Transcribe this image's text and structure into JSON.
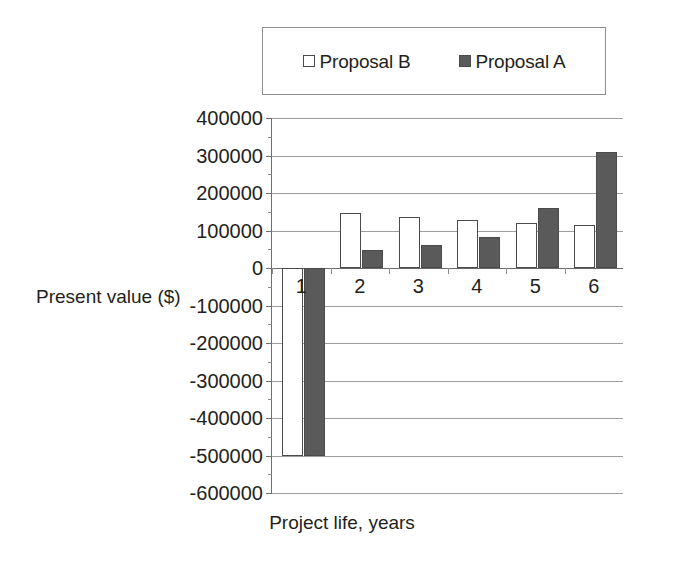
{
  "chart_data": {
    "type": "bar",
    "title": "",
    "xlabel": "Project life, years",
    "ylabel": "Present value ($)",
    "categories": [
      "1",
      "2",
      "3",
      "4",
      "5",
      "6"
    ],
    "series": [
      {
        "name": "Proposal B",
        "values": [
          -500000,
          147000,
          137000,
          128000,
          120000,
          115000
        ],
        "color": "#ffffff"
      },
      {
        "name": "Proposal A",
        "values": [
          -500000,
          48000,
          62000,
          83000,
          160000,
          310000
        ],
        "color": "#5a5a5a"
      }
    ],
    "ylim": [
      -600000,
      400000
    ],
    "ytick_step": 100000,
    "yticks": [
      400000,
      300000,
      200000,
      100000,
      0,
      -100000,
      -200000,
      -300000,
      -400000,
      -500000,
      -600000
    ],
    "ytick_labels": [
      "400000",
      "300000",
      "200000",
      "100000",
      "0",
      "-100000",
      "-200000",
      "-300000",
      "-400000",
      "-500000",
      "-600000"
    ],
    "grid": true,
    "legend_position": "top"
  },
  "legend": {
    "entries": [
      {
        "label": "Proposal B",
        "marker": "hollow-square"
      },
      {
        "label": "Proposal A",
        "marker": "filled-square"
      }
    ]
  },
  "colors": {
    "series_a_fill": "#5a5a5a",
    "series_b_fill": "#ffffff",
    "bar_outline": "#4a4a4a",
    "gridline": "#9e9e9e",
    "axis": "#6f6f6f",
    "text": "#231f20"
  }
}
